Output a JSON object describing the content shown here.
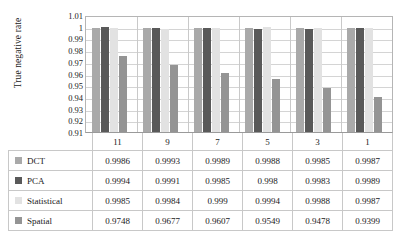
{
  "chart_data": {
    "type": "bar",
    "title": "",
    "xlabel": "",
    "ylabel": "True negative rate",
    "categories": [
      "11",
      "9",
      "7",
      "5",
      "3",
      "1"
    ],
    "ylim": [
      0.91,
      1.01
    ],
    "yticks": [
      "1.01",
      "1",
      "0.99",
      "0.98",
      "0.97",
      "0.96",
      "0.95",
      "0.94",
      "0.93",
      "0.92",
      "0.91"
    ],
    "grid": true,
    "legend_position": "table-left",
    "series": [
      {
        "name": "DCT",
        "color": "#a9a9a9",
        "values": [
          0.9986,
          0.9993,
          0.9989,
          0.9988,
          0.9985,
          0.9987
        ],
        "labels": [
          "0.9986",
          "0.9993",
          "0.9989",
          "0.9988",
          "0.9985",
          "0.9987"
        ]
      },
      {
        "name": "PCA",
        "color": "#595959",
        "values": [
          0.9994,
          0.9991,
          0.9985,
          0.998,
          0.9983,
          0.9989
        ],
        "labels": [
          "0.9994",
          "0.9991",
          "0.9985",
          "0.998",
          "0.9983",
          "0.9989"
        ]
      },
      {
        "name": "Statistical",
        "color": "#e2e2e2",
        "values": [
          0.9985,
          0.9984,
          0.999,
          0.9994,
          0.9988,
          0.9987
        ],
        "labels": [
          "0.9985",
          "0.9984",
          "0.999",
          "0.9994",
          "0.9988",
          "0.9987"
        ]
      },
      {
        "name": "Spatial",
        "color": "#949494",
        "values": [
          0.9748,
          0.9677,
          0.9607,
          0.9549,
          0.9478,
          0.9399
        ],
        "labels": [
          "0.9748",
          "0.9677",
          "0.9607",
          "0.9549",
          "0.9478",
          "0.9399"
        ]
      }
    ]
  }
}
